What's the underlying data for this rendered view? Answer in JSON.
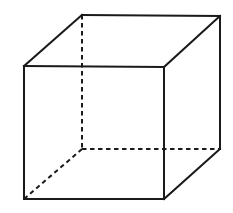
{
  "diagram": {
    "type": "wireframe-cube",
    "stroke_color": "#1a1a1a",
    "background": "#ffffff",
    "vertices": {
      "front_top_left": [
        24,
        66
      ],
      "front_top_right": [
        164,
        67
      ],
      "front_bottom_right": [
        164,
        199
      ],
      "front_bottom_left": [
        24,
        199
      ],
      "back_top_left": [
        82,
        15
      ],
      "back_top_right": [
        220,
        16
      ],
      "back_bottom_right": [
        220,
        149
      ],
      "back_bottom_left": [
        82,
        149
      ]
    },
    "visible_edges": [
      [
        "front_top_left",
        "front_top_right"
      ],
      [
        "front_top_right",
        "front_bottom_right"
      ],
      [
        "front_bottom_right",
        "front_bottom_left"
      ],
      [
        "front_bottom_left",
        "front_top_left"
      ],
      [
        "back_top_left",
        "back_top_right"
      ],
      [
        "back_top_right",
        "back_bottom_right"
      ],
      [
        "front_top_left",
        "back_top_left"
      ],
      [
        "front_top_right",
        "back_top_right"
      ],
      [
        "front_bottom_right",
        "back_bottom_right"
      ]
    ],
    "hidden_edges": [
      [
        "back_top_left",
        "back_bottom_left"
      ],
      [
        "back_bottom_left",
        "back_bottom_right"
      ],
      [
        "back_bottom_left",
        "front_bottom_left"
      ]
    ]
  }
}
